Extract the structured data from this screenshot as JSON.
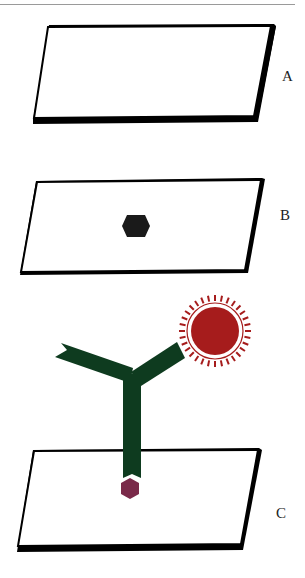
{
  "figure": {
    "panels": [
      {
        "id": "A",
        "label": "A",
        "contents": "empty surface"
      },
      {
        "id": "B",
        "label": "B",
        "contents": "surface with bound antigen (black hexagon)"
      },
      {
        "id": "C",
        "label": "C",
        "contents": "surface with immobilized antigen (maroon hexagon) bound by Y-shaped antibody carrying a red spiked label"
      }
    ],
    "colors": {
      "plate_fill": "#ffffff",
      "plate_edge": "#000000",
      "antigen_b": "#1a1a1a",
      "antigen_c": "#7a2a4a",
      "antibody": "#0e3b1f",
      "label_core": "#a61c1c",
      "label_ring": "#a61c1c"
    }
  }
}
